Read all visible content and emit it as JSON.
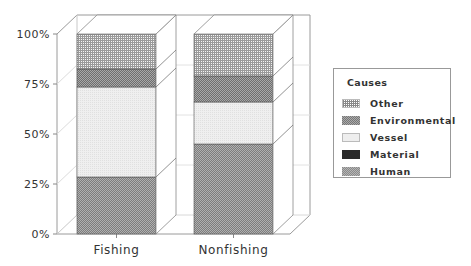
{
  "chart_data": {
    "type": "bar",
    "stacked": true,
    "percent": true,
    "style": "3d",
    "title": "",
    "xlabel": "",
    "ylabel": "",
    "ylim": [
      0,
      100
    ],
    "yticks": [
      "0%",
      "25%",
      "50%",
      "75%",
      "100%"
    ],
    "categories": [
      "Fishing",
      "Nonfishing"
    ],
    "series": [
      {
        "name": "Human",
        "values": [
          28.5,
          45
        ],
        "pattern": "checker-dark",
        "color": "#8a8a8a"
      },
      {
        "name": "Material",
        "values": [
          0,
          0
        ],
        "pattern": "solid-black",
        "color": "#2a2a2a"
      },
      {
        "name": "Vessel",
        "values": [
          45,
          21
        ],
        "pattern": "light",
        "color": "#eeeeee"
      },
      {
        "name": "Environmental",
        "values": [
          9,
          13
        ],
        "pattern": "checker-medium",
        "color": "#777777"
      },
      {
        "name": "Other",
        "values": [
          17.5,
          21
        ],
        "pattern": "grid",
        "color": "#dddddd"
      }
    ],
    "legend": {
      "title": "Causes",
      "position": "right",
      "entries": [
        "Other",
        "Environmental",
        "Vessel",
        "Material",
        "Human"
      ]
    },
    "grid": true
  },
  "legend": {
    "title": "Causes",
    "items": [
      {
        "label": "Other",
        "swatch": "sw-other"
      },
      {
        "label": "Environmental",
        "swatch": "sw-env"
      },
      {
        "label": "Vessel",
        "swatch": "sw-vessel"
      },
      {
        "label": "Material",
        "swatch": "sw-material"
      },
      {
        "label": "Human",
        "swatch": "sw-human"
      }
    ]
  },
  "axis": {
    "yticks": [
      "0%",
      "25%",
      "50%",
      "75%",
      "100%"
    ],
    "categories": [
      "Fishing",
      "Nonfishing"
    ]
  }
}
